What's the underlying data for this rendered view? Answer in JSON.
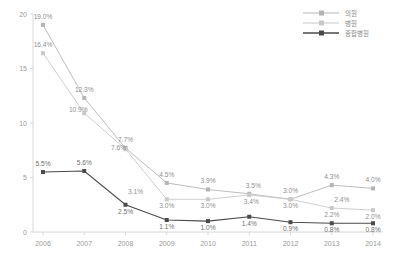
{
  "chart_data": {
    "type": "line",
    "title": "",
    "xlabel": "",
    "ylabel": "",
    "categories": [
      "2006",
      "2007",
      "2008",
      "2009",
      "2010",
      "2011",
      "2012",
      "2013",
      "2014"
    ],
    "ylim": [
      0,
      20
    ],
    "yticks": [
      "0",
      "5",
      "10",
      "15",
      "20"
    ],
    "grid": false,
    "legend_position": "top-right",
    "series": [
      {
        "name": "의원",
        "color": "#b5b5b5",
        "marker": "square",
        "values": [
          19.0,
          12.3,
          7.7,
          4.5,
          3.9,
          3.5,
          3.0,
          4.3,
          4.0
        ],
        "labels": [
          "19.0%",
          "12.3%",
          "7.7%",
          "4.5%",
          "3.9%",
          "3.5%",
          "3.0%",
          "4.3%",
          "4.0%"
        ]
      },
      {
        "name": "병원",
        "color": "#c9c9c9",
        "marker": "square",
        "values": [
          16.4,
          10.9,
          7.6,
          3.0,
          3.0,
          3.4,
          3.0,
          2.2,
          2.0
        ],
        "labels": [
          "16.4%",
          "10.9%",
          "7.6%",
          "3.0%",
          "3.0%",
          "3.4%",
          "3.0%",
          "2.2%",
          "2.0%"
        ]
      },
      {
        "name": "종합병원",
        "color": "#4a4a4a",
        "marker": "square",
        "values": [
          5.5,
          5.6,
          2.5,
          1.1,
          1.0,
          1.4,
          0.9,
          0.8,
          0.8
        ],
        "labels": [
          "5.5%",
          "5.6%",
          "2.5%",
          "1.1%",
          "1.0%",
          "1.4%",
          "0.9%",
          "0.8%",
          "0.8%"
        ]
      }
    ],
    "extra_annotations": [
      {
        "text": "3.1%",
        "x_category": "2008",
        "value": 3.1,
        "note": "label near 2008 upper"
      },
      {
        "text": "2.4%",
        "x_category": "2013",
        "value": 2.4,
        "note": "label above 2.2% point"
      }
    ]
  },
  "legend": {
    "items": [
      {
        "label": "의원"
      },
      {
        "label": "병원"
      },
      {
        "label": "종합병원"
      }
    ]
  }
}
